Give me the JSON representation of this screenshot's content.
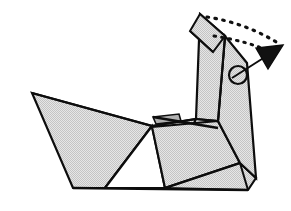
{
  "figure": {
    "background_color": "#ffffff",
    "line_color": "#0d0d0d",
    "paper_fill": "#d6d6d6",
    "paper_fill_light": "#dedede",
    "paper_fill_shadow": "#c9c9c9",
    "paper_fill_white": "#ffffff"
  },
  "facets": [
    {
      "name": "tail-wing-upper",
      "label": "Upper left wing panel",
      "fill": "#d8d8d8",
      "points": "32,93 152,126 117,170 80,170",
      "stroke_width": 2.2
    },
    {
      "name": "tail-wing-lower",
      "label": "Lower left tail panel",
      "fill": "#d8d8d8",
      "points": "32,93 117,170 80,170 73,188 105,188",
      "stroke_width": 2.2
    },
    {
      "name": "tail-panel-main",
      "label": "Left tail triangle",
      "fill": "#d8d8d8",
      "points": "32,93 152,126 105,188 73,188",
      "stroke_width": 2.2
    },
    {
      "name": "body-center-panel",
      "label": "Center body panel",
      "fill": "#d6d6d6",
      "points": "152,126 196,119 165,188 105,188",
      "stroke_width": 2.2
    },
    {
      "name": "body-gap-triangle",
      "label": "White triangular opening under body",
      "fill": "#ffffff",
      "points": "152,126 105,188 165,188",
      "stroke_width": 2.2
    },
    {
      "name": "body-right-panel",
      "label": "Right body panel",
      "fill": "#d6d6d6",
      "points": "152,127 218,121 240,163 165,188",
      "stroke_width": 2.2
    },
    {
      "name": "body-right-lower",
      "label": "Right lower body wedge",
      "fill": "#d2d2d2",
      "points": "165,188 240,163 256,178 248,190",
      "stroke_width": 2.2
    },
    {
      "name": "neck-front-panel",
      "label": "Neck front panel",
      "fill": "#d4d4d4",
      "points": "200,14 196,119 218,121 225,36",
      "stroke_width": 2.2
    },
    {
      "name": "neck-back-panel",
      "label": "Neck back panel",
      "fill": "#cfcfcf",
      "points": "225,36 218,121 240,163 256,178 247,63",
      "stroke_width": 2.2
    },
    {
      "name": "head-tip-flap",
      "label": "Head tip flap",
      "fill": "#dcdcdc",
      "points": "200,14 225,36 213,52 190,31",
      "stroke_width": 2.0
    },
    {
      "name": "ridge-flap-sliver",
      "label": "Small crease flap at ridge",
      "fill": "#b8b8b8",
      "points": "153,117 179,114 181,121 156,124",
      "stroke_width": 1.6
    }
  ],
  "creases": [
    {
      "name": "crease-tail-spine",
      "d": "M32,93 L152,126",
      "stroke_width": 2.2
    },
    {
      "name": "crease-body-ridge",
      "d": "M152,126 L196,119",
      "stroke_width": 2.0
    },
    {
      "name": "crease-ridge-extension",
      "d": "M153,117 L218,128",
      "stroke_width": 2.4
    },
    {
      "name": "crease-neck-fold",
      "d": "M218,121 L196,119",
      "stroke_width": 2.0
    },
    {
      "name": "crease-body-right-diag",
      "d": "M165,188 L240,163",
      "stroke_width": 2.2
    },
    {
      "name": "crease-base-line",
      "d": "M73,188 L248,190",
      "stroke_width": 2.4
    },
    {
      "name": "crease-head-flap",
      "d": "M190,31 L213,52",
      "stroke_width": 1.8
    },
    {
      "name": "crease-neck-inner",
      "d": "M225,36 L218,121",
      "stroke_width": 1.8
    },
    {
      "name": "crease-lower-right-tip",
      "d": "M240,163 L248,190",
      "stroke_width": 2.0
    }
  ],
  "annotations": {
    "rotation_pivot": {
      "name": "rotation-pivot-circle",
      "label": "Rotation pivot marker",
      "cx": 238,
      "cy": 75,
      "r": 9,
      "stroke_width": 2.2
    },
    "motion_arrow": {
      "name": "fold-direction-arrow",
      "label": "Fold direction arrow",
      "shaft": "M232,78 L265,57",
      "head_points": "283,45 256,48 268,69",
      "stroke_width": 2.0,
      "fill": "#111111"
    },
    "dotted_guides": [
      {
        "name": "dotted-guide-outer",
        "label": "Outer dotted motion trace",
        "d": "M207,17 C233,21 258,30 281,45",
        "dash": "1.6 6.4",
        "stroke_width": 3.2
      },
      {
        "name": "dotted-guide-inner",
        "label": "Inner dotted motion trace",
        "d": "M214,36 C238,40 258,45 277,55",
        "dash": "1.6 6.0",
        "stroke_width": 3.0
      }
    ]
  }
}
